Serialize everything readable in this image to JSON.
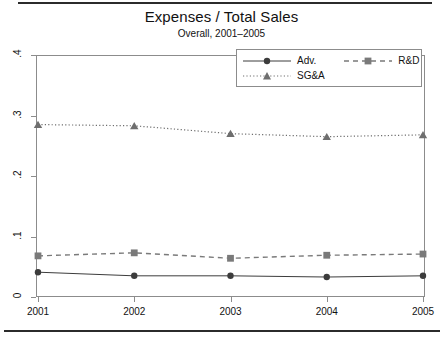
{
  "chart_data": {
    "type": "line",
    "title": "Expenses / Total Sales",
    "subtitle": "Overall, 2001–2005",
    "xlabel": "",
    "ylabel": "",
    "categories": [
      "2001",
      "2002",
      "2003",
      "2004",
      "2005"
    ],
    "x": [
      2001,
      2002,
      2003,
      2004,
      2005
    ],
    "ylim": [
      0,
      0.4
    ],
    "xlim": [
      2001,
      2005
    ],
    "yticks": [
      "0",
      ".1",
      ".2",
      ".3",
      ".4"
    ],
    "ytick_values": [
      0,
      0.1,
      0.2,
      0.3,
      0.4
    ],
    "xticks": [
      "2001",
      "2002",
      "2003",
      "2004",
      "2005"
    ],
    "grid": false,
    "legend_position": "top-right-inside",
    "series": [
      {
        "name": "Adv.",
        "marker": "circle",
        "linestyle": "solid",
        "color": "#3c3c3c",
        "values": [
          0.041,
          0.035,
          0.035,
          0.033,
          0.035
        ]
      },
      {
        "name": "R&D",
        "marker": "square",
        "linestyle": "dashed",
        "color": "#7a7a7a",
        "values": [
          0.068,
          0.073,
          0.064,
          0.069,
          0.071
        ]
      },
      {
        "name": "SG&A",
        "marker": "triangle",
        "linestyle": "dotted",
        "color": "#6e6e6e",
        "values": [
          0.285,
          0.283,
          0.27,
          0.265,
          0.268
        ]
      }
    ]
  },
  "legend": {
    "entries": [
      {
        "label": "Adv."
      },
      {
        "label": "R&D"
      },
      {
        "label": "SG&A"
      }
    ]
  },
  "colors": {
    "axis": "#8c8c8c",
    "text": "#111111",
    "adv": "#3c3c3c",
    "rd": "#7a7a7a",
    "sga": "#6e6e6e",
    "background": "#ffffff"
  }
}
